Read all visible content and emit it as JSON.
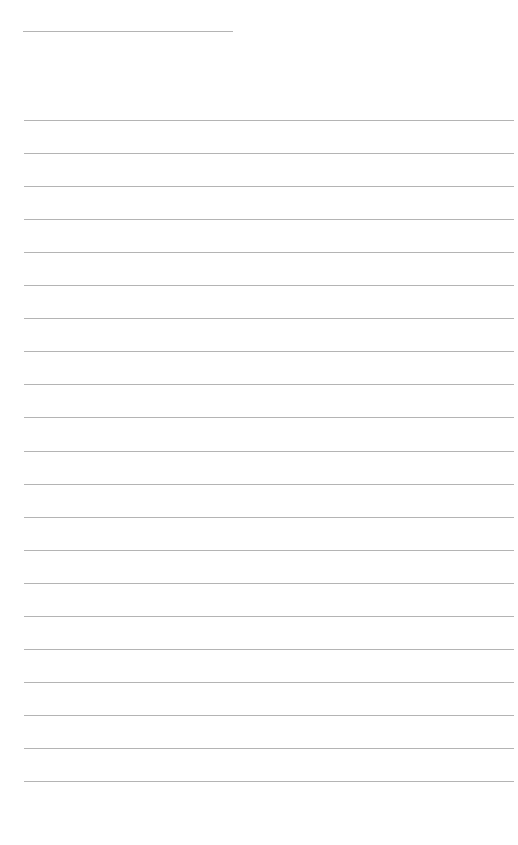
{
  "page": {
    "background": "#ffffff",
    "line_color": "#b4b4b4"
  },
  "header_line": {
    "x": 23,
    "y": 31,
    "width": 210
  },
  "ruled_lines": {
    "x": 24,
    "width": 490,
    "start_y": 120,
    "spacing": 33.05,
    "count": 21
  }
}
